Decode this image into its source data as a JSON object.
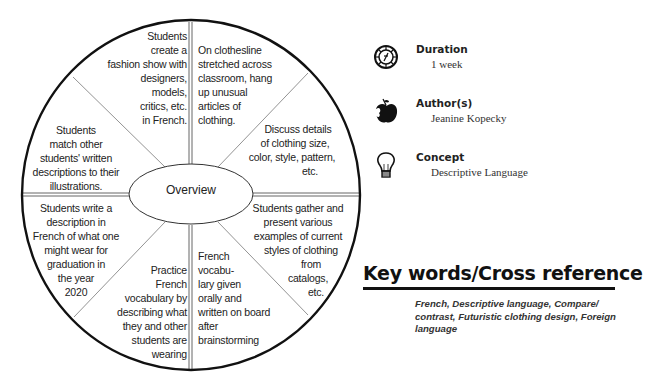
{
  "diagram": {
    "center_label": "Overview",
    "segments": [
      {
        "id": "top-left",
        "lines": [
          "Students",
          "create a",
          "fashion show with",
          "designers,",
          "models,",
          "critics, etc.",
          "in French."
        ]
      },
      {
        "id": "top-right",
        "lines": [
          "On clothesline",
          "stretched across",
          "classroom, hang",
          "up unusual",
          "articles of",
          "clothing."
        ]
      },
      {
        "id": "right-upper",
        "lines": [
          "Discuss details",
          "of clothing size,",
          "color, style, pattern,",
          "etc."
        ]
      },
      {
        "id": "right-lower",
        "lines": [
          "Students gather and",
          "present various",
          "examples of current",
          "styles of clothing",
          "from",
          "catalogs,",
          "etc."
        ]
      },
      {
        "id": "bottom-right",
        "lines": [
          "French",
          "vocabu-",
          "lary given",
          "orally and",
          "written on board",
          "after",
          "brainstorming"
        ]
      },
      {
        "id": "bottom-left",
        "lines": [
          "Practice",
          "French",
          "vocabulary by",
          "describing what",
          "they and other",
          "students are",
          "wearing"
        ]
      },
      {
        "id": "left-lower",
        "lines": [
          "Students write a",
          "description in",
          "French of what one",
          "might wear for",
          "graduation in",
          "the year",
          "2020"
        ]
      },
      {
        "id": "left-upper",
        "lines": [
          "Students",
          "match other",
          "students' written",
          "descriptions to their",
          "illustrations."
        ]
      }
    ]
  },
  "info": [
    {
      "icon": "compass-clock-icon",
      "title": "Duration",
      "value": "1 week"
    },
    {
      "icon": "apple-icon",
      "title": "Author(s)",
      "value": "Jeanine Kopecky"
    },
    {
      "icon": "lightbulb-icon",
      "title": "Concept",
      "value": "Descriptive Language"
    }
  ],
  "keywords": {
    "title": "Key words/Cross reference",
    "text": "French, Descriptive language, Compare/ contrast, Futuristic clothing design, Foreign language",
    "lines": [
      "French, Descriptive language, Compare/",
      "contrast, Futuristic clothing design, Foreign",
      "language"
    ]
  }
}
